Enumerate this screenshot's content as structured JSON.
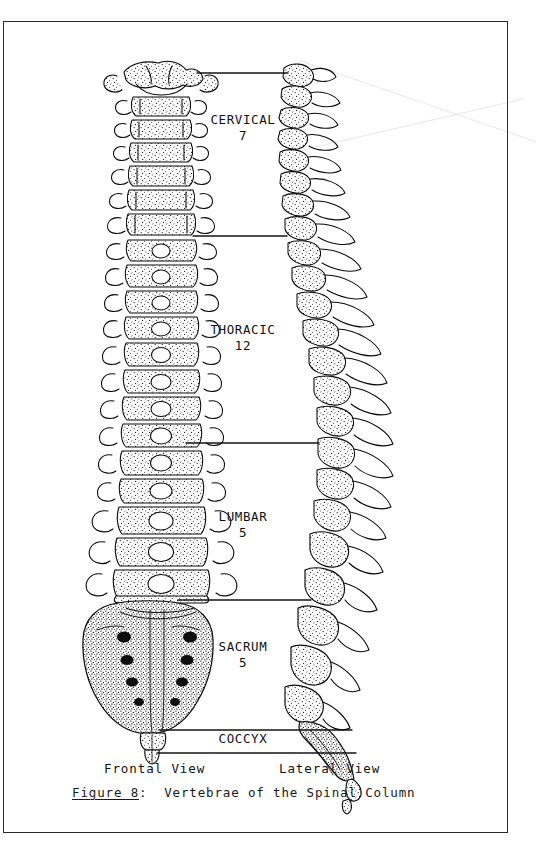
{
  "figure": {
    "caption_number": "Figure 8",
    "caption_separator": ":",
    "caption_text": "Vertebrae of the Spinal Column"
  },
  "views": {
    "frontal": "Frontal View",
    "lateral": "Lateral View"
  },
  "regions": [
    {
      "id": "cervical",
      "name": "CERVICAL",
      "count": "7",
      "label": "CERVICAL\n7"
    },
    {
      "id": "thoracic",
      "name": "THORACIC",
      "count": "12",
      "label": "THORACIC\n12"
    },
    {
      "id": "lumbar",
      "name": "LUMBAR",
      "count": "5",
      "label": "LUMBAR\n5"
    },
    {
      "id": "sacrum",
      "name": "SACRUM",
      "count": "5",
      "label": "SACRUM\n5"
    },
    {
      "id": "coccyx",
      "name": "COCCYX",
      "count": "",
      "label": "COCCYX"
    }
  ],
  "colors": {
    "ink": "#0a0a0a",
    "paper": "#ffffff",
    "frame": "#2a2a2a",
    "stipple": "#1c1c1c"
  }
}
